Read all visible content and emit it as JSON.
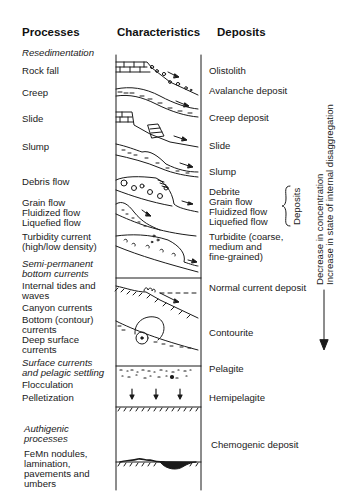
{
  "headers": {
    "processes": "Processes",
    "characteristics": "Characteristics",
    "deposits": "Deposits"
  },
  "processes": [
    {
      "label": "Resedimentation",
      "italic": true
    },
    {
      "label": "Rock fall"
    },
    {
      "label": "Creep"
    },
    {
      "label": "Slide"
    },
    {
      "label": "Slump"
    },
    {
      "label": "Debris flow"
    },
    {
      "label": "Grain flow\nFluidized flow\nLiquefied flow"
    },
    {
      "label": "Turbidity current\n(high/low density)"
    },
    {
      "label": "Semi-permanent\nbottom currents",
      "italic": true
    },
    {
      "label": "Internal tides and\nwaves"
    },
    {
      "label": "Canyon currents"
    },
    {
      "label": "Bottom (contour)\ncurrents"
    },
    {
      "label": "Deep surface\ncurrents"
    },
    {
      "label": "Surface currents\nand pelagic settling",
      "italic": true
    },
    {
      "label": "Flocculation"
    },
    {
      "label": "Pelletization"
    },
    {
      "label": "Authigenic\nprocesses",
      "italic": true
    },
    {
      "label": "FeMn nodules,\nlamination,\npavements and\numbers"
    }
  ],
  "deposits": [
    {
      "label": "Olistolith"
    },
    {
      "label": "Avalanche deposit"
    },
    {
      "label": "Creep deposit"
    },
    {
      "label": "Slide"
    },
    {
      "label": "Slump"
    },
    {
      "label": "Debrite\nGrain flow\nFluidized flow\nLiquefied flow"
    },
    {
      "label": "Turbidite (coarse,\nmedium and\nfine-grained)"
    },
    {
      "label": "Normal current deposit"
    },
    {
      "label": "Contourite"
    },
    {
      "label": "Pelagite"
    },
    {
      "label": "Hemipelagite"
    },
    {
      "label": "Chemogenic deposit"
    }
  ],
  "brace_label": "Deposits",
  "trend": {
    "line1": "Decrease in concentration",
    "line2": "Increase in state of internal disaggregation"
  },
  "characteristics_sketches": [
    "rock-fall-sketch",
    "creep-sketch",
    "slide-sketch",
    "slump-sketch",
    "debris-flow-sketch",
    "grain-flow-sketch",
    "turbidity-current-sketch",
    "internal-tides-sketch",
    "contour-current-sketch",
    "pelagic-settling-sketch",
    "chemogenic-sketch"
  ],
  "colors": {
    "ink": "#1a1a1a",
    "background": "#ffffff"
  }
}
